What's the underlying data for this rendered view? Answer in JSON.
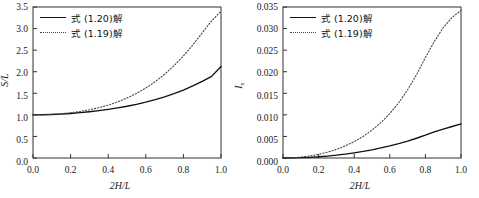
{
  "figure": {
    "panel_count": 2,
    "background_color": "#ffffff",
    "line_color": "#111111",
    "dotted_color": "#444444"
  },
  "chart_data": [
    {
      "panel": "left",
      "type": "line",
      "title": "",
      "xlabel": "2H/L",
      "ylabel": "S/L",
      "ylabel_parts": {
        "symbol": "S",
        "slash": "/",
        "denominator": "L"
      },
      "xlabel_parts": {
        "coefficient": "2",
        "symbol": "H",
        "slash": "/",
        "denominator": "L"
      },
      "xlim": [
        0.0,
        1.0
      ],
      "ylim": [
        0.0,
        3.5
      ],
      "grid": false,
      "xticks": [
        0.0,
        0.2,
        0.4,
        0.6,
        0.8,
        1.0
      ],
      "xticklabels": [
        "0.0",
        "0.2",
        "0.4",
        "0.6",
        "0.8",
        "1.0"
      ],
      "yticks": [
        0.0,
        0.5,
        1.0,
        1.5,
        2.0,
        2.5,
        3.0,
        3.5
      ],
      "yticklabels": [
        "0.0",
        "0.5",
        "1.0",
        "1.5",
        "2.0",
        "2.5",
        "3.0",
        "3.5"
      ],
      "legend_position": "upper-left",
      "series": [
        {
          "name": "式 (1.20)解",
          "style": "solid",
          "color": "#111111",
          "x": [
            0.0,
            0.05,
            0.1,
            0.15,
            0.2,
            0.25,
            0.3,
            0.35,
            0.4,
            0.45,
            0.5,
            0.55,
            0.6,
            0.65,
            0.7,
            0.75,
            0.8,
            0.85,
            0.9,
            0.95,
            1.0
          ],
          "values": [
            1.0,
            1.002,
            1.008,
            1.018,
            1.032,
            1.05,
            1.072,
            1.098,
            1.128,
            1.162,
            1.2,
            1.244,
            1.294,
            1.352,
            1.418,
            1.492,
            1.576,
            1.67,
            1.775,
            1.892,
            2.12
          ]
        },
        {
          "name": "式 (1.19)解",
          "style": "dotted",
          "color": "#444444",
          "x": [
            0.0,
            0.05,
            0.1,
            0.15,
            0.2,
            0.25,
            0.3,
            0.35,
            0.4,
            0.45,
            0.5,
            0.55,
            0.6,
            0.65,
            0.7,
            0.75,
            0.8,
            0.85,
            0.9,
            0.95,
            1.0
          ],
          "values": [
            1.0,
            1.003,
            1.012,
            1.028,
            1.05,
            1.08,
            1.118,
            1.166,
            1.226,
            1.3,
            1.39,
            1.496,
            1.622,
            1.77,
            1.942,
            2.14,
            2.366,
            2.62,
            2.9,
            3.18,
            3.4
          ]
        }
      ]
    },
    {
      "panel": "right",
      "type": "line",
      "title": "",
      "xlabel": "2H/L",
      "ylabel": "Is",
      "ylabel_parts": {
        "symbol": "I",
        "subscript": "s"
      },
      "xlabel_parts": {
        "coefficient": "2",
        "symbol": "H",
        "slash": "/",
        "denominator": "L"
      },
      "xlim": [
        0.0,
        1.0
      ],
      "ylim": [
        0.0,
        0.035
      ],
      "grid": false,
      "xticks": [
        0.0,
        0.2,
        0.4,
        0.6,
        0.8,
        1.0
      ],
      "xticklabels": [
        "0.0",
        "0.2",
        "0.4",
        "0.6",
        "0.8",
        "1.0"
      ],
      "yticks": [
        0.0,
        0.005,
        0.01,
        0.015,
        0.02,
        0.025,
        0.03,
        0.035
      ],
      "yticklabels": [
        "0.000",
        "0.005",
        "0.010",
        "0.015",
        "0.020",
        "0.025",
        "0.030",
        "0.035"
      ],
      "legend_position": "upper-left",
      "series": [
        {
          "name": "式 (1.20)解",
          "style": "solid",
          "color": "#111111",
          "x": [
            0.0,
            0.05,
            0.1,
            0.15,
            0.2,
            0.25,
            0.3,
            0.35,
            0.4,
            0.45,
            0.5,
            0.55,
            0.6,
            0.65,
            0.7,
            0.75,
            0.8,
            0.85,
            0.9,
            0.95,
            1.0
          ],
          "values": [
            0.0,
            2e-05,
            7e-05,
            0.00016,
            0.00028,
            0.00045,
            0.00065,
            0.0009,
            0.00119,
            0.00152,
            0.0019,
            0.00233,
            0.00281,
            0.00334,
            0.00393,
            0.00458,
            0.00529,
            0.00607,
            0.0067,
            0.0073,
            0.0079
          ]
        },
        {
          "name": "式 (1.19)解",
          "style": "dotted",
          "color": "#444444",
          "x": [
            0.0,
            0.05,
            0.1,
            0.15,
            0.2,
            0.25,
            0.3,
            0.35,
            0.4,
            0.45,
            0.5,
            0.55,
            0.6,
            0.65,
            0.7,
            0.75,
            0.8,
            0.85,
            0.9,
            0.95,
            1.0
          ],
          "values": [
            0.0,
            5e-05,
            0.0002,
            0.00047,
            0.00085,
            0.00135,
            0.002,
            0.00281,
            0.0038,
            0.005,
            0.00645,
            0.0082,
            0.0103,
            0.0128,
            0.0158,
            0.0193,
            0.0233,
            0.027,
            0.0302,
            0.0326,
            0.0342
          ]
        }
      ]
    }
  ],
  "legend": {
    "entries": [
      {
        "label": "式 (1.20)解",
        "style": "solid"
      },
      {
        "label": "式 (1.19)解",
        "style": "dotted"
      }
    ]
  }
}
